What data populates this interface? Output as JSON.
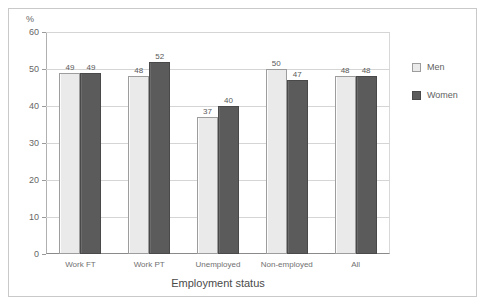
{
  "chart_data": {
    "type": "bar",
    "title": "",
    "subtitle": "",
    "xlabel": "Employment status",
    "ylabel": "%",
    "ylim": [
      0,
      60
    ],
    "ytick_step": 10,
    "yticks": [
      "0",
      "10",
      "20",
      "30",
      "40",
      "50",
      "60"
    ],
    "grid": true,
    "legend_position": "right",
    "categories": [
      "Work FT",
      "Work PT",
      "Unemployed",
      "Non-employed",
      "All"
    ],
    "series": [
      {
        "name": "Men",
        "color": "#eaeaea",
        "values": [
          49,
          48,
          37,
          50,
          48
        ]
      },
      {
        "name": "Women",
        "color": "#5b5b5b",
        "values": [
          49,
          52,
          40,
          47,
          48
        ]
      }
    ],
    "data_labels": [
      {
        "category": "Work FT",
        "men": "49",
        "women": "49"
      },
      {
        "category": "Work PT",
        "men": "48",
        "women": "52"
      },
      {
        "category": "Unemployed",
        "men": "37",
        "women": "40"
      },
      {
        "category": "Non-employed",
        "men": "50",
        "women": "47"
      },
      {
        "category": "All",
        "men": "48",
        "women": "48"
      }
    ]
  },
  "axes": {
    "y_unit": "%"
  },
  "legend": {
    "items": [
      {
        "label": "Men"
      },
      {
        "label": "Women"
      }
    ]
  }
}
